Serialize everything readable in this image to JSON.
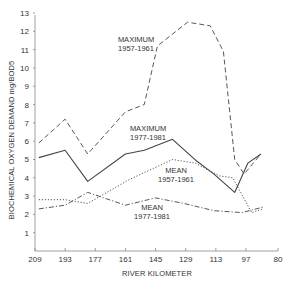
{
  "chart_data": {
    "type": "line",
    "title": "",
    "xlabel": "RIVER KILOMETER",
    "ylabel": "BIOCHEMICAL OXYGEN DEMAND mg/BOD5",
    "xlim": [
      209,
      80
    ],
    "ylim": [
      0,
      13
    ],
    "x_reversed": true,
    "grid": false,
    "x_ticks": [
      209,
      193,
      177,
      161,
      145,
      129,
      113,
      97,
      80
    ],
    "y_ticks": [
      1,
      2,
      3,
      4,
      5,
      6,
      7,
      8,
      9,
      10,
      11,
      12,
      13
    ],
    "series": [
      {
        "name": "MAXIMUM 1957-1961",
        "style": "dashed",
        "label_lines": [
          "MAXIMUM",
          "1957-1961"
        ],
        "x": [
          207,
          193,
          181,
          161,
          151,
          144,
          128,
          116,
          109,
          103,
          98,
          89
        ],
        "y": [
          5.9,
          7.2,
          5.3,
          7.6,
          8.0,
          11.2,
          12.5,
          12.3,
          10.9,
          5.0,
          4.2,
          5.3
        ]
      },
      {
        "name": "MAXIMUM 1977-1981",
        "style": "solid",
        "label_lines": [
          "MAXIMUM",
          "1977-1981"
        ],
        "x": [
          207,
          193,
          181,
          161,
          151,
          136,
          123,
          114,
          103,
          96,
          89
        ],
        "y": [
          5.1,
          5.5,
          3.8,
          5.3,
          5.5,
          6.1,
          4.9,
          4.2,
          3.2,
          4.8,
          5.3
        ]
      },
      {
        "name": "MEAN 1957-1961",
        "style": "dotted",
        "label_lines": [
          "MEAN",
          "1957-1961"
        ],
        "x": [
          207,
          193,
          181,
          159,
          136,
          124,
          111,
          104,
          94,
          88
        ],
        "y": [
          2.8,
          2.8,
          2.6,
          3.9,
          5.0,
          4.8,
          4.1,
          4.0,
          2.1,
          2.3
        ]
      },
      {
        "name": "MEAN 1977-1981",
        "style": "dashdot",
        "label_lines": [
          "MEAN",
          "1977-1981"
        ],
        "x": [
          207,
          193,
          181,
          161,
          145,
          130,
          114,
          99,
          88
        ],
        "y": [
          2.3,
          2.5,
          3.2,
          2.5,
          2.9,
          2.6,
          2.2,
          2.1,
          2.4
        ]
      }
    ]
  }
}
